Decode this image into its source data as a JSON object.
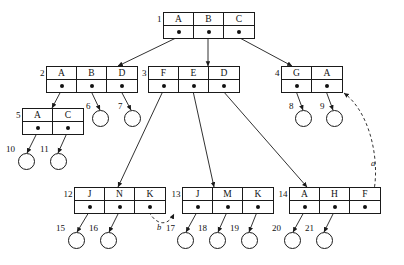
{
  "diagram": {
    "stroke_color": "#1a1a1a",
    "background": "#ffffff"
  },
  "nodes": [
    {
      "id": "1",
      "label": "1",
      "x": 163,
      "y": 12,
      "keys": [
        "A",
        "B",
        "C"
      ]
    },
    {
      "id": "2",
      "label": "2",
      "x": 46,
      "y": 66,
      "keys": [
        "A",
        "B",
        "D"
      ]
    },
    {
      "id": "3",
      "label": "3",
      "x": 148,
      "y": 66,
      "keys": [
        "F",
        "E",
        "D"
      ]
    },
    {
      "id": "4",
      "label": "4",
      "x": 281,
      "y": 66,
      "keys": [
        "G",
        "A"
      ]
    },
    {
      "id": "5",
      "label": "5",
      "x": 22,
      "y": 108,
      "keys": [
        "A",
        "C"
      ]
    },
    {
      "id": "12",
      "label": "12",
      "x": 74,
      "y": 187,
      "keys": [
        "J",
        "N",
        "K"
      ]
    },
    {
      "id": "13",
      "label": "13",
      "x": 182,
      "y": 187,
      "keys": [
        "J",
        "M",
        "K"
      ]
    },
    {
      "id": "14",
      "label": "14",
      "x": 289,
      "y": 187,
      "keys": [
        "A",
        "H",
        "F"
      ]
    }
  ],
  "leaves": [
    {
      "id": "6",
      "label": "6",
      "cx": 100,
      "cy": 118,
      "label_x": 86,
      "label_y": 101
    },
    {
      "id": "7",
      "label": "7",
      "cx": 132,
      "cy": 118,
      "label_x": 118,
      "label_y": 101
    },
    {
      "id": "8",
      "label": "8",
      "cx": 303,
      "cy": 118,
      "label_x": 289,
      "label_y": 101
    },
    {
      "id": "9",
      "label": "9",
      "cx": 334,
      "cy": 118,
      "label_x": 320,
      "label_y": 101
    },
    {
      "id": "10",
      "label": "10",
      "cx": 26,
      "cy": 161,
      "label_x": 6,
      "label_y": 144
    },
    {
      "id": "11",
      "label": "11",
      "cx": 58,
      "cy": 161,
      "label_x": 40,
      "label_y": 144
    },
    {
      "id": "15",
      "label": "15",
      "cx": 76,
      "cy": 240,
      "label_x": 56,
      "label_y": 223
    },
    {
      "id": "16",
      "label": "16",
      "cx": 108,
      "cy": 240,
      "label_x": 89,
      "label_y": 223
    },
    {
      "id": "17",
      "label": "17",
      "cx": 185,
      "cy": 240,
      "label_x": 166,
      "label_y": 223
    },
    {
      "id": "18",
      "label": "18",
      "cx": 217,
      "cy": 240,
      "label_x": 198,
      "label_y": 223
    },
    {
      "id": "19",
      "label": "19",
      "cx": 249,
      "cy": 240,
      "label_x": 230,
      "label_y": 223
    },
    {
      "id": "20",
      "label": "20",
      "cx": 292,
      "cy": 240,
      "label_x": 272,
      "label_y": 223
    },
    {
      "id": "21",
      "label": "21",
      "cx": 324,
      "cy": 240,
      "label_x": 305,
      "label_y": 223
    }
  ],
  "edges": [
    {
      "from": "1.A",
      "to": "2",
      "x1": 178,
      "y1": 37,
      "x2": 118,
      "y2": 66
    },
    {
      "from": "1.B",
      "to": "3",
      "x1": 208,
      "y1": 37,
      "x2": 208,
      "y2": 66
    },
    {
      "from": "1.C",
      "to": "4",
      "x1": 238,
      "y1": 37,
      "x2": 292,
      "y2": 66
    },
    {
      "from": "2.A",
      "to": "5",
      "x1": 61,
      "y1": 91,
      "x2": 52,
      "y2": 108
    },
    {
      "from": "2.B",
      "to": "6",
      "x1": 91,
      "y1": 91,
      "x2": 100,
      "y2": 110
    },
    {
      "from": "2.D",
      "to": "7",
      "x1": 121,
      "y1": 91,
      "x2": 131,
      "y2": 110
    },
    {
      "from": "3.F",
      "to": "12",
      "x1": 163,
      "y1": 91,
      "x2": 118,
      "y2": 187
    },
    {
      "from": "3.E",
      "to": "13",
      "x1": 193,
      "y1": 91,
      "x2": 214,
      "y2": 187
    },
    {
      "from": "3.D",
      "to": "14",
      "x1": 223,
      "y1": 91,
      "x2": 307,
      "y2": 187
    },
    {
      "from": "4.G",
      "to": "8",
      "x1": 296,
      "y1": 91,
      "x2": 303,
      "y2": 110
    },
    {
      "from": "4.A",
      "to": "9",
      "x1": 326,
      "y1": 91,
      "x2": 333,
      "y2": 110
    },
    {
      "from": "5.A",
      "to": "10",
      "x1": 37,
      "y1": 133,
      "x2": 27,
      "y2": 153
    },
    {
      "from": "5.C",
      "to": "11",
      "x1": 67,
      "y1": 133,
      "x2": 58,
      "y2": 153
    },
    {
      "from": "12.J",
      "to": "15",
      "x1": 89,
      "y1": 212,
      "x2": 77,
      "y2": 232
    },
    {
      "from": "12.N",
      "to": "16",
      "x1": 119,
      "y1": 212,
      "x2": 109,
      "y2": 232
    },
    {
      "from": "13.J",
      "to": "17",
      "x1": 197,
      "y1": 212,
      "x2": 186,
      "y2": 232
    },
    {
      "from": "13.M",
      "to": "18",
      "x1": 227,
      "y1": 212,
      "x2": 218,
      "y2": 232
    },
    {
      "from": "13.K",
      "to": "19",
      "x1": 257,
      "y1": 212,
      "x2": 249,
      "y2": 232
    },
    {
      "from": "14.A",
      "to": "20",
      "x1": 304,
      "y1": 212,
      "x2": 293,
      "y2": 232
    },
    {
      "from": "14.H",
      "to": "21",
      "x1": 334,
      "y1": 212,
      "x2": 324,
      "y2": 232
    }
  ],
  "dashed_edges": [
    {
      "id": "b",
      "label": "b",
      "from": "12.K",
      "to": "13",
      "path": "M 149 212 C 157 226 168 226 174 214",
      "label_x": 157,
      "label_y": 222
    },
    {
      "id": "a",
      "label": "a",
      "from": "14.F",
      "to": "4",
      "path": "M 364 212 C 383 196 380 120 344 93",
      "label_x": 371,
      "label_y": 158
    }
  ]
}
